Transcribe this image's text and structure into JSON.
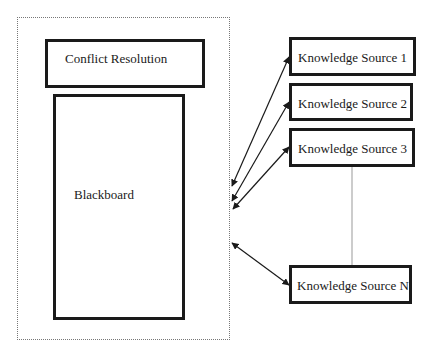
{
  "diagram": {
    "type": "blackboard-architecture",
    "system": {
      "conflict_resolution": {
        "label": "Conflict Resolution"
      },
      "blackboard": {
        "label": "Blackboard"
      }
    },
    "knowledge_sources": [
      {
        "label": "Knowledge Source 1"
      },
      {
        "label": "Knowledge Source 2"
      },
      {
        "label": "Knowledge Source 3"
      },
      {
        "label": "Knowledge Source N"
      }
    ],
    "edges": [
      {
        "from": "Knowledge Source 1",
        "to": "system",
        "style": "arrow-both"
      },
      {
        "from": "Knowledge Source 2",
        "to": "system",
        "style": "arrow-both"
      },
      {
        "from": "Knowledge Source 3",
        "to": "system",
        "style": "arrow-both"
      },
      {
        "from": "Knowledge Source N",
        "to": "system",
        "style": "arrow-both"
      },
      {
        "from": "Knowledge Source 3",
        "to": "Knowledge Source N",
        "style": "thin-line"
      }
    ]
  }
}
